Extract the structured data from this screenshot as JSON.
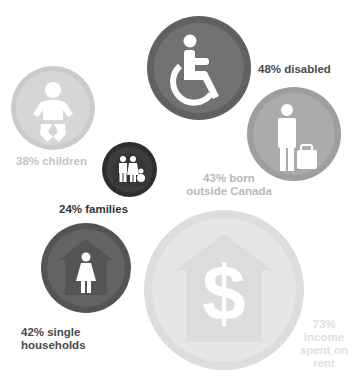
{
  "stats": [
    {
      "id": "disabled",
      "percent": "48%",
      "label_lines": [
        "48% disabled"
      ],
      "icon": "wheelchair-icon",
      "fill": "#727272",
      "ring": "#616161",
      "text_color": "#4a4a4a"
    },
    {
      "id": "children",
      "percent": "38%",
      "label_lines": [
        "38% children"
      ],
      "icon": "baby-icon",
      "fill": "#d6d6d6",
      "ring": "#cbcbcb",
      "text_color": "#c4c4c4"
    },
    {
      "id": "families",
      "percent": "24%",
      "label_lines": [
        "24% families"
      ],
      "icon": "family-house-icon",
      "fill": "#3d3d3d",
      "ring": "#2e2e2e",
      "text_color": "#333333"
    },
    {
      "id": "immigrants",
      "percent": "43%",
      "label_lines": [
        "43% born",
        "outside Canada"
      ],
      "icon": "traveler-luggage-icon",
      "fill": "#ababab",
      "ring": "#9e9e9e",
      "text_color": "#b8b8b8"
    },
    {
      "id": "single",
      "percent": "42%",
      "label_lines": [
        "42% single",
        "households"
      ],
      "icon": "woman-house-icon",
      "fill": "#636363",
      "ring": "#545454",
      "text_color": "#4a4a4a"
    },
    {
      "id": "rent",
      "percent": "73%",
      "label_lines": [
        "73%",
        "income",
        "spent on",
        "rent"
      ],
      "icon": "dollar-house-icon",
      "fill": "#e6e6e6",
      "ring": "#dddddd",
      "text_color": "#e0e0e0"
    }
  ]
}
